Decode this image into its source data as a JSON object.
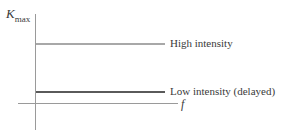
{
  "diagram": {
    "y_axis_label": {
      "symbol": "K",
      "subscript": "max"
    },
    "x_axis_label": "f",
    "lines": [
      {
        "label": "High intensity",
        "color": "#a8a8a8"
      },
      {
        "label": "Low intensity (delayed)",
        "color": "#5a5a5a"
      }
    ]
  }
}
